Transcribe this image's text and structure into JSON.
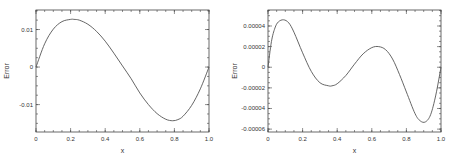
{
  "chart_data": [
    {
      "type": "line",
      "title": "",
      "xlabel": "x",
      "ylabel": "Error",
      "xlim": [
        0,
        1.0
      ],
      "ylim": [
        -0.0173,
        0.0152
      ],
      "grid": false,
      "xticks": [
        0,
        0.2,
        0.4,
        0.6,
        0.8,
        1.0
      ],
      "xtick_labels": [
        "0",
        "0.2",
        "0.4",
        "0.6",
        "0.8",
        "1.0"
      ],
      "x_minor_step": 0.05,
      "yticks": [
        0.01,
        0,
        -0.01
      ],
      "ytick_labels": [
        "0.01",
        "0",
        "-0.01"
      ],
      "y_minor_step": 0.0025,
      "series": [
        {
          "name": "Error",
          "x": [
            0,
            0.05,
            0.1,
            0.15,
            0.2,
            0.22,
            0.25,
            0.3,
            0.35,
            0.4,
            0.45,
            0.5,
            0.55,
            0.6,
            0.65,
            0.7,
            0.75,
            0.79,
            0.82,
            0.85,
            0.9,
            0.95,
            1.0
          ],
          "y": [
            0,
            0.0062,
            0.0101,
            0.0121,
            0.0127,
            0.0127,
            0.0125,
            0.0114,
            0.0095,
            0.0069,
            0.0037,
            0.0003,
            -0.0031,
            -0.0069,
            -0.01,
            -0.0124,
            -0.0139,
            -0.0143,
            -0.014,
            -0.0131,
            -0.0102,
            -0.0058,
            0
          ]
        }
      ]
    },
    {
      "type": "line",
      "title": "",
      "xlabel": "x",
      "ylabel": "Error",
      "xlim": [
        0,
        1.0
      ],
      "ylim": [
        -6.28e-05,
        5.55e-05
      ],
      "grid": false,
      "xticks": [
        0,
        0.2,
        0.4,
        0.6,
        0.8,
        1.0
      ],
      "xtick_labels": [
        "0",
        "0.2",
        "0.4",
        "0.6",
        "0.8",
        "1.0"
      ],
      "x_minor_step": 0.05,
      "yticks": [
        4e-05,
        2e-05,
        0,
        -2e-05,
        -4e-05,
        -6e-05
      ],
      "ytick_labels": [
        "0.00004",
        "0.00002",
        "0",
        "-0.00002",
        "-0.00004",
        "-0.00006"
      ],
      "y_minor_step": 5e-06,
      "series": [
        {
          "name": "Error",
          "x": [
            0,
            0.02,
            0.04,
            0.06,
            0.09,
            0.12,
            0.15,
            0.2,
            0.25,
            0.3,
            0.35,
            0.37,
            0.4,
            0.45,
            0.5,
            0.55,
            0.6,
            0.64,
            0.68,
            0.72,
            0.76,
            0.8,
            0.85,
            0.88,
            0.91,
            0.94,
            0.97,
            1.0
          ],
          "y": [
            0,
            2.5e-05,
            3.8e-05,
            4.4e-05,
            4.6e-05,
            4.3e-05,
            3.4e-05,
            1.4e-05,
            -4e-06,
            -1.5e-05,
            -1.8e-05,
            -1.8e-05,
            -1.6e-05,
            -8e-06,
            3e-06,
            1.3e-05,
            1.9e-05,
            2e-05,
            1.7e-05,
            8e-06,
            -7e-06,
            -2.4e-05,
            -4.5e-05,
            -5.2e-05,
            -5.3e-05,
            -4.6e-05,
            -2.7e-05,
            0
          ]
        }
      ]
    }
  ]
}
